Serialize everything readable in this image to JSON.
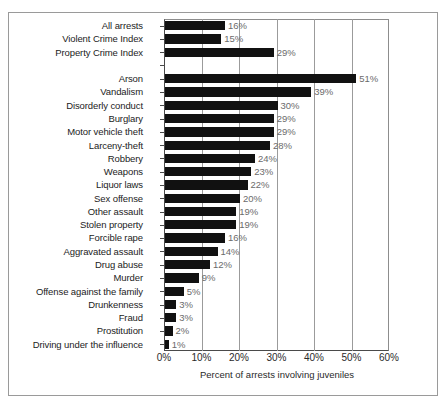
{
  "figure": {
    "x_axis_title": "Percent of arrests involving juveniles"
  },
  "chart_data": {
    "type": "bar",
    "orientation": "horizontal",
    "title": "",
    "subtitle": "",
    "xlabel": "Percent of arrests involving juveniles",
    "ylabel": "",
    "xlim": [
      0,
      60
    ],
    "grid": true,
    "legend": false,
    "xticks": [
      "0%",
      "10%",
      "20%",
      "30%",
      "40%",
      "50%",
      "60%"
    ],
    "xtick_values": [
      0,
      10,
      20,
      30,
      40,
      50,
      60
    ],
    "bar_color": "#111111",
    "value_label_color": "#6b6b6b",
    "categories": [
      "All arrests",
      "Violent Crime Index",
      "Property Crime Index",
      "",
      "Arson",
      "Vandalism",
      "Disorderly conduct",
      "Burglary",
      "Motor vehicle theft",
      "Larceny-theft",
      "Robbery",
      "Weapons",
      "Liquor laws",
      "Sex offense",
      "Other assault",
      "Stolen property",
      "Forcible rape",
      "Aggravated assault",
      "Drug abuse",
      "Murder",
      "Offense against the family",
      "Drunkenness",
      "Fraud",
      "Prostitution",
      "Driving under the influence"
    ],
    "values": [
      16,
      15,
      29,
      null,
      51,
      39,
      30,
      29,
      29,
      28,
      24,
      23,
      22,
      20,
      19,
      19,
      16,
      14,
      12,
      9,
      5,
      3,
      3,
      2,
      1
    ],
    "value_labels": [
      "16%",
      "15%",
      "29%",
      "",
      "51%",
      "39%",
      "30%",
      "29%",
      "29%",
      "28%",
      "24%",
      "23%",
      "22%",
      "20%",
      "19%",
      "19%",
      "16%",
      "14%",
      "12%",
      "9%",
      "5%",
      "3%",
      "3%",
      "2%",
      "1%"
    ],
    "rows": [
      {
        "label": "All arrests",
        "value": 16,
        "value_label": "16%",
        "spacer": false
      },
      {
        "label": "Violent Crime Index",
        "value": 15,
        "value_label": "15%",
        "spacer": false
      },
      {
        "label": "Property Crime Index",
        "value": 29,
        "value_label": "29%",
        "spacer": false
      },
      {
        "label": "",
        "value": 0,
        "value_label": "",
        "spacer": true
      },
      {
        "label": "Arson",
        "value": 51,
        "value_label": "51%",
        "spacer": false
      },
      {
        "label": "Vandalism",
        "value": 39,
        "value_label": "39%",
        "spacer": false
      },
      {
        "label": "Disorderly conduct",
        "value": 30,
        "value_label": "30%",
        "spacer": false
      },
      {
        "label": "Burglary",
        "value": 29,
        "value_label": "29%",
        "spacer": false
      },
      {
        "label": "Motor vehicle theft",
        "value": 29,
        "value_label": "29%",
        "spacer": false
      },
      {
        "label": "Larceny-theft",
        "value": 28,
        "value_label": "28%",
        "spacer": false
      },
      {
        "label": "Robbery",
        "value": 24,
        "value_label": "24%",
        "spacer": false
      },
      {
        "label": "Weapons",
        "value": 23,
        "value_label": "23%",
        "spacer": false
      },
      {
        "label": "Liquor laws",
        "value": 22,
        "value_label": "22%",
        "spacer": false
      },
      {
        "label": "Sex offense",
        "value": 20,
        "value_label": "20%",
        "spacer": false
      },
      {
        "label": "Other assault",
        "value": 19,
        "value_label": "19%",
        "spacer": false
      },
      {
        "label": "Stolen property",
        "value": 19,
        "value_label": "19%",
        "spacer": false
      },
      {
        "label": "Forcible rape",
        "value": 16,
        "value_label": "16%",
        "spacer": false
      },
      {
        "label": "Aggravated assault",
        "value": 14,
        "value_label": "14%",
        "spacer": false
      },
      {
        "label": "Drug abuse",
        "value": 12,
        "value_label": "12%",
        "spacer": false
      },
      {
        "label": "Murder",
        "value": 9,
        "value_label": "9%",
        "spacer": false
      },
      {
        "label": "Offense against the family",
        "value": 5,
        "value_label": "5%",
        "spacer": false
      },
      {
        "label": "Drunkenness",
        "value": 3,
        "value_label": "3%",
        "spacer": false
      },
      {
        "label": "Fraud",
        "value": 3,
        "value_label": "3%",
        "spacer": false
      },
      {
        "label": "Prostitution",
        "value": 2,
        "value_label": "2%",
        "spacer": false
      },
      {
        "label": "Driving under the influence",
        "value": 1,
        "value_label": "1%",
        "spacer": false
      }
    ]
  }
}
